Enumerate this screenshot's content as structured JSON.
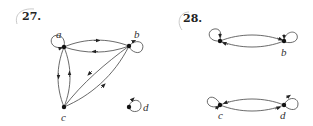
{
  "problems": [
    {
      "number": "27.",
      "nodes": [
        {
          "id": "a",
          "label": "a"
        },
        {
          "id": "b",
          "label": "b"
        },
        {
          "id": "c",
          "label": "c"
        },
        {
          "id": "d",
          "label": "d"
        }
      ],
      "edges": [
        {
          "from": "a",
          "to": "a",
          "type": "loop"
        },
        {
          "from": "a",
          "to": "b"
        },
        {
          "from": "b",
          "to": "a"
        },
        {
          "from": "b",
          "to": "b",
          "type": "loop"
        },
        {
          "from": "a",
          "to": "c"
        },
        {
          "from": "c",
          "to": "a"
        },
        {
          "from": "b",
          "to": "c"
        },
        {
          "from": "c",
          "to": "b"
        },
        {
          "from": "d",
          "to": "d",
          "type": "loop"
        }
      ]
    },
    {
      "number": "28.",
      "nodes": [
        {
          "id": "a",
          "label": ""
        },
        {
          "id": "b",
          "label": "b"
        },
        {
          "id": "c",
          "label": "c"
        },
        {
          "id": "d",
          "label": "d"
        }
      ],
      "edges": [
        {
          "from": "a",
          "to": "a",
          "type": "loop"
        },
        {
          "from": "a",
          "to": "b"
        },
        {
          "from": "b",
          "to": "a"
        },
        {
          "from": "b",
          "to": "b",
          "type": "loop"
        },
        {
          "from": "c",
          "to": "c",
          "type": "loop"
        },
        {
          "from": "c",
          "to": "d"
        },
        {
          "from": "d",
          "to": "c"
        },
        {
          "from": "d",
          "to": "d",
          "type": "loop"
        }
      ]
    }
  ],
  "colors": {
    "edge": "#444444",
    "node": "#111111",
    "circle_mark": "#bbbbbb"
  }
}
